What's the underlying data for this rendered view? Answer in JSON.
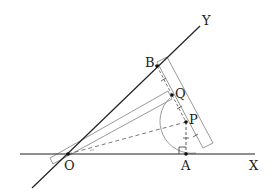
{
  "diagram": {
    "type": "geometry-construction",
    "labels": {
      "O": "O",
      "A": "A",
      "B": "B",
      "P": "P",
      "Q": "Q",
      "X": "X",
      "Y": "Y"
    },
    "points": {
      "O": [
        68,
        154
      ],
      "A": [
        186,
        154
      ],
      "B": [
        157,
        66
      ],
      "Q": [
        172,
        95
      ],
      "P": [
        186,
        122
      ]
    },
    "rays": {
      "OX": {
        "from": [
          20,
          154
        ],
        "to": [
          255,
          154
        ]
      },
      "OY": {
        "from": [
          32,
          188
        ],
        "to": [
          200,
          26
        ]
      }
    },
    "colors": {
      "line": "#222222",
      "tool": "#999999",
      "background": "#ffffff"
    }
  }
}
